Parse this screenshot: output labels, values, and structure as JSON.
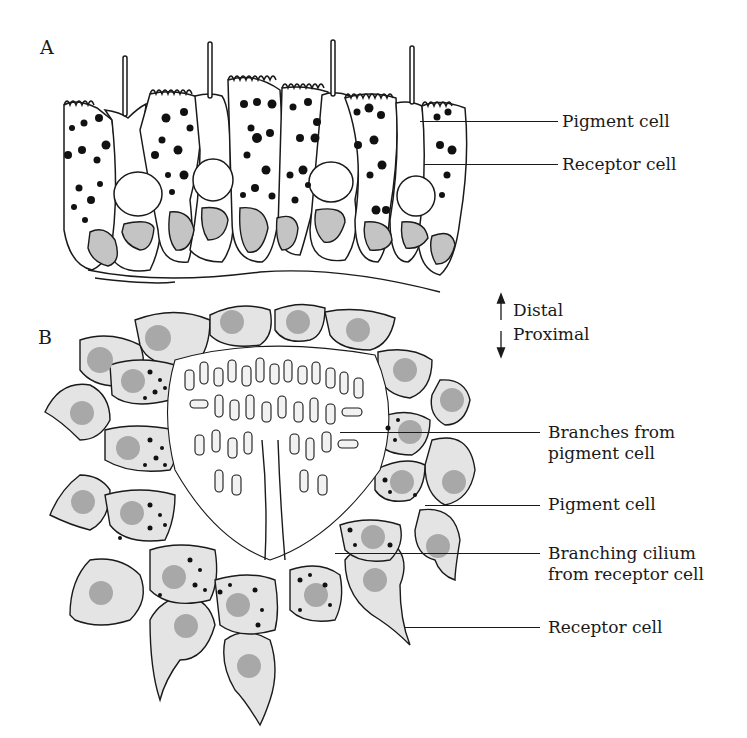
{
  "figure": {
    "panel_a": {
      "letter": "A",
      "labels": [
        {
          "text": "Pigment cell"
        },
        {
          "text": "Receptor cell"
        }
      ]
    },
    "orientation": {
      "distal": "Distal",
      "proximal": "Proximal"
    },
    "panel_b": {
      "letter": "B",
      "labels": [
        {
          "line1": "Branches from",
          "line2": "pigment cell"
        },
        {
          "line1": "Pigment cell"
        },
        {
          "line1": "Branching cilium",
          "line2": "from receptor cell"
        },
        {
          "line1": "Receptor cell"
        }
      ]
    },
    "colors": {
      "outline": "#1a1a1a",
      "cell_fill_b": "#e4e4e4",
      "nucleus_fill": "#a8a8a8",
      "pigment_granule": "#111111",
      "background": "#ffffff"
    }
  }
}
